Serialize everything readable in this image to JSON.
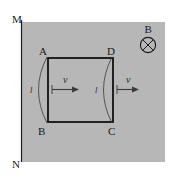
{
  "figure": {
    "background_color": "#ffffff",
    "field_region_color": "#b7b7b7",
    "line_color": "#1a1a1a",
    "boundary": {
      "top_label": "M",
      "bottom_label": "N"
    },
    "field": {
      "symbol_label": "B",
      "symbol_name": "circle-cross-into-page"
    },
    "loop": {
      "corner_top_left": "A",
      "corner_bottom_left": "B",
      "corner_bottom_right": "C",
      "corner_top_right": "D"
    },
    "velocity_arrows": [
      {
        "label": "v"
      },
      {
        "label": "v"
      }
    ],
    "length_arcs": [
      {
        "label": "l"
      },
      {
        "label": "l"
      }
    ]
  }
}
